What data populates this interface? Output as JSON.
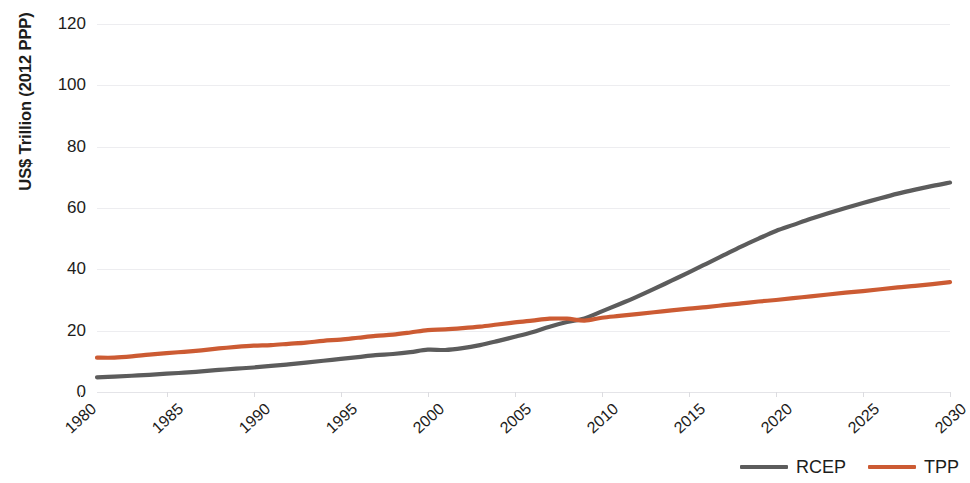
{
  "chart_data": {
    "type": "line",
    "title": "",
    "subtitle": "",
    "xlabel": "",
    "ylabel": "US$ Trillion (2012 PPP)",
    "grid": true,
    "legend_position": "bottom-right",
    "xlim": [
      1981,
      2030
    ],
    "ylim": [
      0,
      120
    ],
    "y_ticks": [
      0,
      20,
      40,
      60,
      80,
      100,
      120
    ],
    "x_ticks": [
      1980,
      1985,
      1990,
      1995,
      2000,
      2005,
      2010,
      2015,
      2020,
      2025,
      2030
    ],
    "x_tick_labels": [
      "1980",
      "1985",
      "1990",
      "1995",
      "2000",
      "2005",
      "2010",
      "2015",
      "2020",
      "2025",
      "2030"
    ],
    "y_tick_labels": [
      "0",
      "20",
      "40",
      "60",
      "80",
      "100",
      "120"
    ],
    "x": [
      1981,
      1982,
      1983,
      1984,
      1985,
      1986,
      1987,
      1988,
      1989,
      1990,
      1991,
      1992,
      1993,
      1994,
      1995,
      1996,
      1997,
      1998,
      1999,
      2000,
      2001,
      2002,
      2003,
      2004,
      2005,
      2006,
      2007,
      2008,
      2009,
      2010,
      2011,
      2012,
      2013,
      2014,
      2015,
      2016,
      2017,
      2018,
      2019,
      2020,
      2021,
      2022,
      2023,
      2024,
      2025,
      2026,
      2027,
      2028,
      2029,
      2030
    ],
    "series": [
      {
        "name": "RCEP",
        "color": "#5c5c5c",
        "values": [
          4.8,
          5.0,
          5.3,
          5.6,
          6.0,
          6.3,
          6.7,
          7.2,
          7.6,
          8.0,
          8.5,
          9.0,
          9.6,
          10.2,
          10.8,
          11.4,
          12.0,
          12.4,
          13.0,
          13.8,
          13.7,
          14.3,
          15.3,
          16.6,
          18.0,
          19.5,
          21.3,
          22.8,
          24.0,
          26.3,
          28.6,
          31.0,
          33.6,
          36.3,
          39.0,
          41.8,
          44.6,
          47.4,
          50.0,
          52.5,
          54.5,
          56.5,
          58.3,
          60.0,
          61.6,
          63.2,
          64.7,
          66.0,
          67.2,
          68.3
        ]
      },
      {
        "name": "TPP",
        "color": "#cc5b33",
        "values": [
          11.2,
          11.2,
          11.6,
          12.2,
          12.7,
          13.1,
          13.6,
          14.2,
          14.7,
          15.1,
          15.3,
          15.7,
          16.1,
          16.7,
          17.1,
          17.7,
          18.3,
          18.7,
          19.4,
          20.2,
          20.4,
          20.8,
          21.3,
          22.0,
          22.7,
          23.3,
          23.9,
          23.9,
          23.3,
          24.2,
          24.8,
          25.4,
          26.0,
          26.6,
          27.2,
          27.7,
          28.3,
          28.9,
          29.5,
          30.0,
          30.6,
          31.2,
          31.8,
          32.4,
          32.9,
          33.5,
          34.1,
          34.6,
          35.2,
          35.8
        ]
      }
    ]
  },
  "legend": {
    "items": [
      {
        "label": "RCEP",
        "color": "#5c5c5c"
      },
      {
        "label": "TPP",
        "color": "#cc5b33"
      }
    ]
  }
}
